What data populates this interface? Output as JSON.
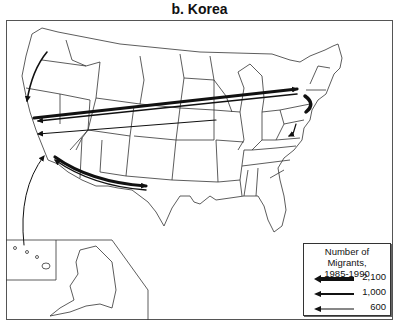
{
  "title": "b. Korea",
  "legend": {
    "title_line1": "Number of Migrants,",
    "title_line2": "1985-1990",
    "items": [
      {
        "label": "2,100",
        "stroke_width": 4
      },
      {
        "label": "1,000",
        "stroke_width": 2
      },
      {
        "label": "600",
        "stroke_width": 1.2
      }
    ]
  },
  "flows": [
    {
      "from": "California",
      "to": "New York",
      "magnitude": "2,100"
    },
    {
      "from": "New York",
      "to": "California",
      "magnitude": "1,000"
    },
    {
      "from": "Illinois",
      "to": "California",
      "magnitude": "600"
    },
    {
      "from": "California",
      "to": "Texas",
      "magnitude": "2,100"
    },
    {
      "from": "Texas",
      "to": "California",
      "magnitude": "1,000"
    },
    {
      "from": "Washington",
      "to": "California",
      "magnitude": "600"
    },
    {
      "from": "Hawaii",
      "to": "California",
      "magnitude": "600"
    },
    {
      "from": "New York",
      "to": "New Jersey",
      "magnitude": "2,100"
    },
    {
      "from": "Maryland",
      "to": "Virginia",
      "magnitude": "600"
    }
  ],
  "colors": {
    "line": "#111111",
    "border": "#555555",
    "background": "#ffffff"
  }
}
